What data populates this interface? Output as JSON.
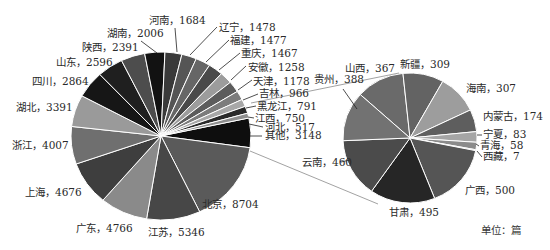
{
  "chart_data": {
    "type": "pie",
    "subtype": "pie-of-pie",
    "unit_label": "单位：篇",
    "main_pie": {
      "total": 55461,
      "slices": [
        {
          "label": "其他",
          "value": 3148,
          "color": "#0e0e0e",
          "lx": 265,
          "ly": 139,
          "anchor": "start",
          "tick": [
            250,
            136,
            262,
            136
          ]
        },
        {
          "label": "北京",
          "value": 8704,
          "color": "#5a5a5a",
          "lx": 202,
          "ly": 208,
          "anchor": "start"
        },
        {
          "label": "江苏",
          "value": 5346,
          "color": "#474747",
          "lx": 148,
          "ly": 236,
          "anchor": "start"
        },
        {
          "label": "广东",
          "value": 4766,
          "color": "#8a8a8a",
          "lx": 76,
          "ly": 232,
          "anchor": "start"
        },
        {
          "label": "上海",
          "value": 4676,
          "color": "#3e3e3e",
          "lx": 25,
          "ly": 196,
          "anchor": "start"
        },
        {
          "label": "浙江",
          "value": 4007,
          "color": "#6f6f6f",
          "lx": 12,
          "ly": 149,
          "anchor": "start"
        },
        {
          "label": "湖北",
          "value": 3391,
          "color": "#9a9a9a",
          "lx": 16,
          "ly": 111,
          "anchor": "start"
        },
        {
          "label": "四川",
          "value": 2864,
          "color": "#161616",
          "lx": 32,
          "ly": 85,
          "anchor": "start"
        },
        {
          "label": "山东",
          "value": 2596,
          "color": "#1f1f1f",
          "lx": 56,
          "ly": 66,
          "anchor": "start"
        },
        {
          "label": "陕西",
          "value": 2391,
          "color": "#4d4d4d",
          "lx": 82,
          "ly": 51,
          "anchor": "start"
        },
        {
          "label": "湖南",
          "value": 2006,
          "color": "#121212",
          "lx": 107,
          "ly": 37,
          "anchor": "start",
          "tick": [
            141,
            41,
            157,
            53
          ]
        },
        {
          "label": "河南",
          "value": 1684,
          "color": "#3a3a3a",
          "lx": 149,
          "ly": 24,
          "anchor": "start",
          "tick": [
            175,
            28,
            177,
            52
          ]
        },
        {
          "label": "辽宁",
          "value": 1478,
          "color": "#555555",
          "lx": 219,
          "ly": 31,
          "anchor": "start",
          "tick": [
            217,
            27,
            190,
            55
          ]
        },
        {
          "label": "福建",
          "value": 1477,
          "color": "#666666",
          "lx": 230,
          "ly": 44,
          "anchor": "start",
          "tick": [
            229,
            40,
            206,
            62
          ]
        },
        {
          "label": "重庆",
          "value": 1467,
          "color": "#4a4a4a",
          "lx": 241,
          "ly": 57,
          "anchor": "start",
          "tick": [
            240,
            53,
            219,
            70
          ]
        },
        {
          "label": "安徽",
          "value": 1258,
          "color": "#9c9c9c",
          "lx": 248,
          "ly": 71,
          "anchor": "start",
          "tick": [
            246,
            66,
            231,
            80
          ]
        },
        {
          "label": "天津",
          "value": 1178,
          "color": "#5c5c5c",
          "lx": 253,
          "ly": 85,
          "anchor": "start",
          "tick": [
            252,
            80,
            238,
            90
          ]
        },
        {
          "label": "吉林",
          "value": 966,
          "color": "#7c7c7c",
          "lx": 259,
          "ly": 97,
          "anchor": "start",
          "tick": [
            258,
            94,
            243,
            100
          ]
        },
        {
          "label": "黑龙江",
          "value": 791,
          "color": "#a8a8a8",
          "lx": 257,
          "ly": 110,
          "anchor": "start",
          "tick": [
            256,
            106,
            246,
            108
          ]
        },
        {
          "label": "江西",
          "value": 750,
          "color": "#2a2a2a",
          "lx": 255,
          "ly": 122,
          "anchor": "start",
          "tick": [
            254,
            118,
            248,
            117
          ]
        },
        {
          "label": "河北",
          "value": 517,
          "color": "#8e8e8e",
          "lx": 265,
          "ly": 131,
          "anchor": "start",
          "tick": [
            263,
            127,
            249,
            124
          ]
        }
      ]
    },
    "secondary_pie": {
      "total": 3148,
      "slices": [
        {
          "label": "山西",
          "value": 367,
          "color": "#6a6a6a",
          "lx": 345,
          "ly": 72,
          "anchor": "start"
        },
        {
          "label": "新疆",
          "value": 309,
          "color": "#636363",
          "lx": 400,
          "ly": 68,
          "anchor": "start"
        },
        {
          "label": "海南",
          "value": 307,
          "color": "#9d9d9d",
          "lx": 466,
          "ly": 92,
          "anchor": "start"
        },
        {
          "label": "内蒙古",
          "value": 174,
          "color": "#5e5e5e",
          "lx": 483,
          "ly": 120,
          "anchor": "start"
        },
        {
          "label": "宁夏",
          "value": 83,
          "color": "#a5a5a5",
          "lx": 483,
          "ly": 138,
          "anchor": "start",
          "tick": [
            482,
            135,
            477,
            135
          ]
        },
        {
          "label": "青海",
          "value": 58,
          "color": "#8b8b8b",
          "lx": 480,
          "ly": 149,
          "anchor": "start",
          "tick": [
            479,
            146,
            476,
            144
          ]
        },
        {
          "label": "西藏",
          "value": 7,
          "color": "#7a7a7a",
          "lx": 483,
          "ly": 160,
          "anchor": "start",
          "tick": [
            482,
            157,
            477,
            151
          ]
        },
        {
          "label": "广西",
          "value": 500,
          "color": "#555555",
          "lx": 465,
          "ly": 194,
          "anchor": "start"
        },
        {
          "label": "甘肃",
          "value": 495,
          "color": "#262626",
          "lx": 389,
          "ly": 216,
          "anchor": "start"
        },
        {
          "label": "云南",
          "value": 460,
          "color": "#4b4b4b",
          "lx": 302,
          "ly": 166,
          "anchor": "start",
          "tick": [
            341,
            162,
            350,
            160
          ]
        },
        {
          "label": "贵州",
          "value": 388,
          "color": "#727272",
          "lx": 314,
          "ly": 83,
          "anchor": "start",
          "tick": [
            343,
            89,
            357,
            109
          ]
        }
      ]
    },
    "labels_separator": "，",
    "title": "",
    "legend": "none"
  }
}
